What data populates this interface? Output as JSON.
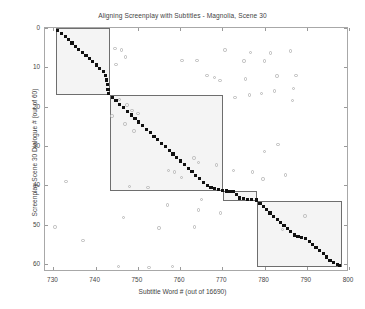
{
  "chart_data": {
    "type": "scatter",
    "title": "Aligning Screenplay with Subtitles - Magnolia, Scene 30",
    "xlabel": "Subtitle Word # (out of 16690)",
    "ylabel": "Screenplay Scene 30 Dialogue # (out of 60)",
    "xlim": [
      728,
      800
    ],
    "ylim": [
      0,
      62
    ],
    "y_axis_inverted": true,
    "xticks": [
      730,
      740,
      750,
      760,
      770,
      780,
      790,
      800
    ],
    "yticks": [
      0,
      10,
      20,
      30,
      40,
      50,
      60
    ],
    "grid": false,
    "legend": null,
    "series": [
      {
        "name": "alignment path",
        "marker": "filled-square",
        "color": "#111111",
        "points": [
          [
            731.0,
            0.6
          ],
          [
            731.9,
            1.4
          ],
          [
            732.8,
            2.2
          ],
          [
            733.6,
            3.0
          ],
          [
            734.4,
            3.8
          ],
          [
            735.2,
            4.6
          ],
          [
            736.0,
            5.4
          ],
          [
            736.9,
            6.2
          ],
          [
            737.7,
            7.0
          ],
          [
            738.5,
            7.8
          ],
          [
            739.3,
            8.6
          ],
          [
            740.2,
            9.4
          ],
          [
            741.0,
            10.2
          ],
          [
            741.8,
            11.0
          ],
          [
            742.3,
            12.0
          ],
          [
            742.6,
            13.2
          ],
          [
            742.8,
            14.4
          ],
          [
            742.9,
            15.6
          ],
          [
            743.0,
            16.6
          ],
          [
            743.9,
            17.6
          ],
          [
            744.8,
            18.5
          ],
          [
            745.7,
            19.4
          ],
          [
            746.6,
            20.3
          ],
          [
            747.5,
            21.2
          ],
          [
            748.4,
            22.1
          ],
          [
            749.3,
            23.0
          ],
          [
            750.2,
            23.9
          ],
          [
            751.1,
            24.8
          ],
          [
            752.0,
            25.7
          ],
          [
            752.9,
            26.6
          ],
          [
            753.8,
            27.5
          ],
          [
            754.7,
            28.4
          ],
          [
            755.6,
            29.3
          ],
          [
            756.5,
            30.2
          ],
          [
            757.4,
            31.1
          ],
          [
            758.3,
            32.0
          ],
          [
            759.2,
            32.9
          ],
          [
            760.1,
            33.8
          ],
          [
            761.0,
            34.7
          ],
          [
            761.9,
            35.6
          ],
          [
            762.8,
            36.5
          ],
          [
            763.7,
            37.4
          ],
          [
            764.6,
            38.3
          ],
          [
            765.5,
            39.2
          ],
          [
            766.4,
            40.1
          ],
          [
            767.3,
            40.6
          ],
          [
            768.2,
            40.8
          ],
          [
            769.1,
            41.0
          ],
          [
            770.0,
            41.2
          ],
          [
            770.9,
            41.4
          ],
          [
            771.8,
            41.5
          ],
          [
            772.7,
            41.6
          ],
          [
            773.3,
            42.4
          ],
          [
            774.1,
            43.2
          ],
          [
            775.0,
            43.4
          ],
          [
            776.0,
            43.5
          ],
          [
            777.0,
            43.6
          ],
          [
            778.0,
            43.7
          ],
          [
            778.9,
            44.6
          ],
          [
            779.7,
            45.4
          ],
          [
            780.5,
            46.2
          ],
          [
            781.3,
            47.0
          ],
          [
            782.1,
            47.8
          ],
          [
            783.0,
            48.6
          ],
          [
            783.8,
            49.4
          ],
          [
            784.6,
            50.2
          ],
          [
            785.4,
            51.0
          ],
          [
            786.2,
            51.8
          ],
          [
            787.1,
            52.6
          ],
          [
            787.9,
            53.0
          ],
          [
            788.8,
            53.2
          ],
          [
            789.7,
            53.4
          ],
          [
            790.6,
            54.2
          ],
          [
            791.4,
            55.0
          ],
          [
            792.2,
            55.8
          ],
          [
            793.0,
            56.6
          ],
          [
            793.9,
            57.4
          ],
          [
            794.7,
            58.2
          ],
          [
            795.5,
            59.0
          ],
          [
            796.3,
            59.6
          ],
          [
            797.2,
            60.0
          ],
          [
            797.8,
            60.4
          ]
        ]
      },
      {
        "name": "candidate matches",
        "marker": "open-circle",
        "color": "#b9b9b9",
        "points": [
          [
            744.6,
            5.2
          ],
          [
            746.1,
            5.6
          ],
          [
            747.0,
            7.4
          ],
          [
            744.8,
            9.2
          ],
          [
            770.6,
            5.6
          ],
          [
            776.7,
            6.2
          ],
          [
            781.4,
            6.4
          ],
          [
            786.2,
            5.8
          ],
          [
            760.4,
            8.2
          ],
          [
            764.0,
            8.2
          ],
          [
            775.1,
            8.4
          ],
          [
            780.0,
            8.4
          ],
          [
            766.4,
            12.0
          ],
          [
            768.2,
            12.6
          ],
          [
            769.4,
            13.4
          ],
          [
            775.5,
            13.0
          ],
          [
            782.9,
            12.2
          ],
          [
            787.4,
            12.0
          ],
          [
            786.8,
            15.4
          ],
          [
            782.4,
            16.0
          ],
          [
            773.0,
            17.6
          ],
          [
            776.5,
            17.0
          ],
          [
            779.3,
            16.6
          ],
          [
            786.6,
            18.4
          ],
          [
            745.6,
            18.2
          ],
          [
            747.4,
            19.6
          ],
          [
            748.6,
            21.0
          ],
          [
            750.0,
            21.8
          ],
          [
            743.9,
            22.4
          ],
          [
            746.9,
            24.4
          ],
          [
            749.1,
            26.2
          ],
          [
            780.0,
            31.4
          ],
          [
            783.2,
            29.6
          ],
          [
            763.3,
            33.0
          ],
          [
            764.4,
            34.2
          ],
          [
            768.6,
            34.8
          ],
          [
            757.2,
            36.2
          ],
          [
            758.6,
            36.6
          ],
          [
            760.3,
            38.0
          ],
          [
            772.7,
            36.2
          ],
          [
            777.2,
            36.6
          ],
          [
            779.6,
            38.4
          ],
          [
            785.0,
            37.4
          ],
          [
            733.0,
            39.0
          ],
          [
            748.0,
            40.2
          ],
          [
            752.4,
            40.6
          ],
          [
            765.0,
            43.6
          ],
          [
            757.0,
            45.0
          ],
          [
            764.4,
            46.2
          ],
          [
            769.6,
            47.0
          ],
          [
            789.6,
            47.8
          ],
          [
            784.2,
            51.2
          ],
          [
            746.6,
            48.2
          ],
          [
            730.4,
            50.6
          ],
          [
            755.0,
            50.8
          ],
          [
            763.4,
            50.6
          ],
          [
            737.0,
            54.0
          ],
          [
            745.4,
            60.6
          ],
          [
            752.6,
            60.8
          ],
          [
            758.2,
            60.6
          ]
        ]
      }
    ],
    "blocks": [
      {
        "name": "block-1",
        "x0": 730.5,
        "x1": 743.3,
        "y0": 0.0,
        "y1": 16.9
      },
      {
        "name": "block-2",
        "x0": 743.3,
        "x1": 770.2,
        "y0": 16.9,
        "y1": 41.3
      },
      {
        "name": "block-3",
        "x0": 770.2,
        "x1": 778.2,
        "y0": 41.3,
        "y1": 43.9
      },
      {
        "name": "block-4",
        "x0": 778.2,
        "x1": 798.4,
        "y0": 43.9,
        "y1": 60.8
      }
    ]
  }
}
